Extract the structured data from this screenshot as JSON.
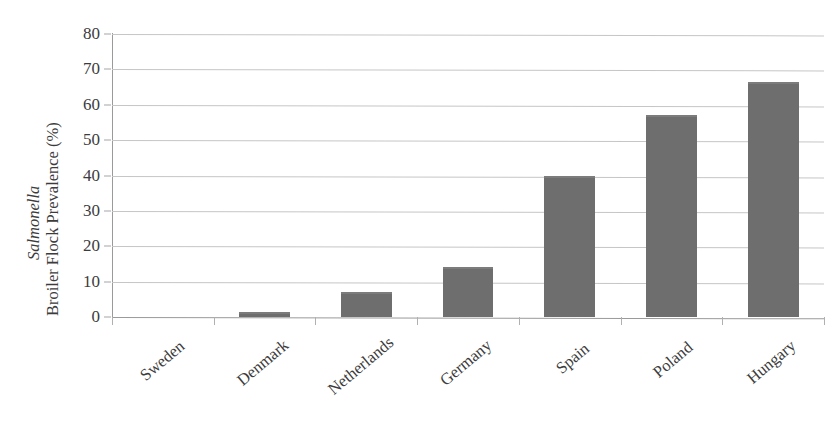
{
  "chart_data": {
    "type": "bar",
    "title": "",
    "subtitle": "",
    "xlabel": "",
    "ylabel": "Salmonella Broiler Flock Prevalence (%)",
    "ylabel_lines": [
      "Salmonella",
      "Broiler Flock Prevalence (%)"
    ],
    "categories": [
      "Sweden",
      "Denmark",
      "Netherlands",
      "Germany",
      "Spain",
      "Poland",
      "Hungary"
    ],
    "values": [
      0,
      1.3,
      7,
      14,
      40,
      57,
      66.5
    ],
    "ylim": [
      0,
      80
    ],
    "yticks": [
      0,
      10,
      20,
      30,
      40,
      50,
      60,
      70,
      80
    ],
    "ytick_labels": [
      "0",
      "10",
      "20",
      "30",
      "40",
      "50",
      "60",
      "70",
      "80"
    ],
    "grid": true,
    "grid_axis": "y",
    "legend": false,
    "legend_position": "none",
    "bar_color": "#6e6e6e",
    "gridline_color": "#c6c6c6",
    "axis_color": "#9a9a9a",
    "background_color": "#ffffff",
    "xtick_label_rotation": -40
  },
  "figure": {
    "top_cropped_caption": "",
    "ghost_strip": ""
  }
}
